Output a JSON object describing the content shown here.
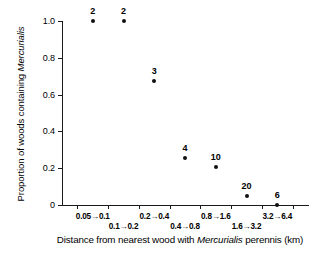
{
  "chart_data": {
    "type": "scatter",
    "title": "",
    "xlabel": "Distance from nearest wood with Mercurialis perennis (km)",
    "xlabel_parts": {
      "before": "Distance from nearest wood with ",
      "italic": "Mercurialis",
      "after": " perennis (km)"
    },
    "ylabel": "Proportion of woods containing Mercurialis",
    "ylabel_parts": {
      "before": "Proportion of woods containing ",
      "italic": "Mercurialis",
      "after": ""
    },
    "grid": false,
    "legend": "none",
    "ylim": [
      0,
      1.0
    ],
    "yticks": [
      "0",
      "0.2",
      "0.4",
      "0.6",
      "0.8",
      "1.0"
    ],
    "ytick_values": [
      0,
      0.2,
      0.4,
      0.6,
      0.8,
      1.0
    ],
    "xticks": [
      "0.05→0.1",
      "0.1→0.2",
      "0.2→0.4",
      "0.4→0.8",
      "0.8→1.6",
      "1.6→3.2",
      "3.2→6.4"
    ],
    "x_categories": [
      "0.05→0.1",
      "0.1→0.2",
      "0.2→0.4",
      "0.4→0.8",
      "0.8→1.6",
      "1.6→3.2",
      "3.2→6.4"
    ],
    "points": [
      {
        "x_category": "0.05→0.1",
        "x_index": 0,
        "y": 1.0,
        "label": "2"
      },
      {
        "x_category": "0.1→0.2",
        "x_index": 1,
        "y": 1.0,
        "label": "2"
      },
      {
        "x_category": "0.2→0.4",
        "x_index": 2,
        "y": 0.675,
        "label": "3"
      },
      {
        "x_category": "0.4→0.8",
        "x_index": 3,
        "y": 0.255,
        "label": "4"
      },
      {
        "x_category": "0.8→1.6",
        "x_index": 4,
        "y": 0.205,
        "label": "10"
      },
      {
        "x_category": "1.6→3.2",
        "x_index": 5,
        "y": 0.05,
        "label": "20"
      },
      {
        "x_category": "3.2→6.4",
        "x_index": 6,
        "y": 0.0,
        "label": "6"
      }
    ],
    "values": [
      1.0,
      1.0,
      0.675,
      0.255,
      0.205,
      0.05,
      0.0
    ],
    "point_labels": [
      "2",
      "2",
      "3",
      "4",
      "10",
      "20",
      "6"
    ],
    "colors": {
      "marker": "#111111",
      "axis": "#1a1a1a",
      "text": "#000000",
      "background": "#ffffff"
    }
  }
}
